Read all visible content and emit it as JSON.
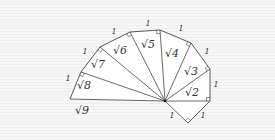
{
  "diagram": {
    "center": [
      165,
      101
    ],
    "vertices": [
      [
        188,
        123
      ],
      [
        210,
        101
      ],
      [
        210,
        69
      ],
      [
        191,
        43
      ],
      [
        160,
        30
      ],
      [
        130,
        32
      ],
      [
        100,
        47
      ],
      [
        81,
        72
      ],
      [
        70,
        99
      ]
    ],
    "hypotenuse_labels": [
      {
        "text": "√2",
        "x": 192,
        "y": 96
      },
      {
        "text": "√3",
        "x": 191,
        "y": 75
      },
      {
        "text": "√4",
        "x": 172,
        "y": 57
      },
      {
        "text": "√5",
        "x": 148,
        "y": 48
      },
      {
        "text": "√6",
        "x": 120,
        "y": 54
      },
      {
        "text": "√7",
        "x": 98,
        "y": 68
      },
      {
        "text": "√8",
        "x": 84,
        "y": 89
      },
      {
        "text": "√9",
        "x": 82,
        "y": 114
      }
    ],
    "unit_labels": [
      {
        "text": "1",
        "x": 172,
        "y": 118
      },
      {
        "text": "1",
        "x": 203,
        "y": 118
      },
      {
        "text": "1",
        "x": 216,
        "y": 87
      },
      {
        "text": "1",
        "x": 207,
        "y": 54
      },
      {
        "text": "1",
        "x": 181,
        "y": 31
      },
      {
        "text": "1",
        "x": 148,
        "y": 26
      },
      {
        "text": "1",
        "x": 114,
        "y": 34
      },
      {
        "text": "1",
        "x": 85,
        "y": 54
      },
      {
        "text": "1",
        "x": 68,
        "y": 81
      }
    ],
    "colors": {
      "line": "#444444",
      "fill": "#ffffff",
      "background": "#f2f2f2"
    }
  }
}
